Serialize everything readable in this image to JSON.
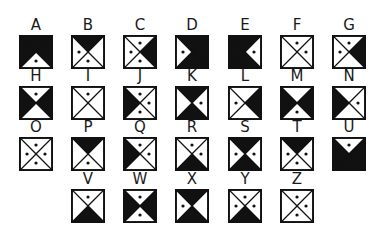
{
  "diagram": {
    "title": "",
    "legend": "Each square is divided by two diagonals into four triangles (top, right, bottom, left). A triangle is 'black' (filled), 'dot' (white with a dot), or 'white' (empty).",
    "colors": {
      "ink": "#111111",
      "paper": "#ffffff"
    },
    "rows": [
      {
        "cells": [
          {
            "letter": "A",
            "top": "black",
            "right": "black",
            "bottom": "dot",
            "left": "black"
          },
          {
            "letter": "B",
            "top": "black",
            "right": "white",
            "bottom": "dot",
            "left": "dot"
          },
          {
            "letter": "C",
            "top": "dot",
            "right": "black",
            "bottom": "dot",
            "left": "dot"
          },
          {
            "letter": "D",
            "top": "black",
            "right": "black",
            "bottom": "black",
            "left": "dot"
          },
          {
            "letter": "E",
            "top": "black",
            "right": "dot",
            "bottom": "black",
            "left": "black"
          },
          {
            "letter": "F",
            "top": "dot",
            "right": "dot",
            "bottom": "white",
            "left": "white"
          },
          {
            "letter": "G",
            "top": "dot",
            "right": "black",
            "bottom": "white",
            "left": "dot"
          }
        ]
      },
      {
        "cells": [
          {
            "letter": "H",
            "top": "dot",
            "right": "black",
            "bottom": "white",
            "left": "black"
          },
          {
            "letter": "I",
            "top": "dot",
            "right": "white",
            "bottom": "white",
            "left": "white"
          },
          {
            "letter": "J",
            "top": "dot",
            "right": "dot",
            "bottom": "dot",
            "left": "black"
          },
          {
            "letter": "K",
            "top": "black",
            "right": "dot",
            "bottom": "black",
            "left": "white"
          },
          {
            "letter": "L",
            "top": "white",
            "right": "black",
            "bottom": "white",
            "left": "dot"
          },
          {
            "letter": "M",
            "top": "white",
            "right": "black",
            "bottom": "dot",
            "left": "black"
          },
          {
            "letter": "N",
            "top": "white",
            "right": "dot",
            "bottom": "white",
            "left": "black"
          }
        ]
      },
      {
        "cells": [
          {
            "letter": "O",
            "top": "dot",
            "right": "dot",
            "bottom": "dot",
            "left": "dot"
          },
          {
            "letter": "P",
            "top": "black",
            "right": "white",
            "bottom": "dot",
            "left": "white"
          },
          {
            "letter": "Q",
            "top": "dot",
            "right": "dot",
            "bottom": "white",
            "left": "black"
          },
          {
            "letter": "R",
            "top": "dot",
            "right": "dot",
            "bottom": "black",
            "left": "white"
          },
          {
            "letter": "S",
            "top": "black",
            "right": "dot",
            "bottom": "black",
            "left": "dot"
          },
          {
            "letter": "T",
            "top": "black",
            "right": "dot",
            "bottom": "dot",
            "left": "dot"
          },
          {
            "letter": "U",
            "top": "dot",
            "right": "black",
            "bottom": "black",
            "left": "black"
          }
        ]
      },
      {
        "cells": [
          {
            "letter": "V",
            "top": "dot",
            "right": "white",
            "bottom": "black",
            "left": "white"
          },
          {
            "letter": "W",
            "top": "dot",
            "right": "black",
            "bottom": "dot",
            "left": "black"
          },
          {
            "letter": "X",
            "top": "black",
            "right": "white",
            "bottom": "black",
            "left": "dot"
          },
          {
            "letter": "Y",
            "top": "dot",
            "right": "dot",
            "bottom": "black",
            "left": "dot"
          },
          {
            "letter": "Z",
            "top": "dot",
            "right": "dot",
            "bottom": "dot",
            "left": "white"
          }
        ]
      }
    ]
  }
}
